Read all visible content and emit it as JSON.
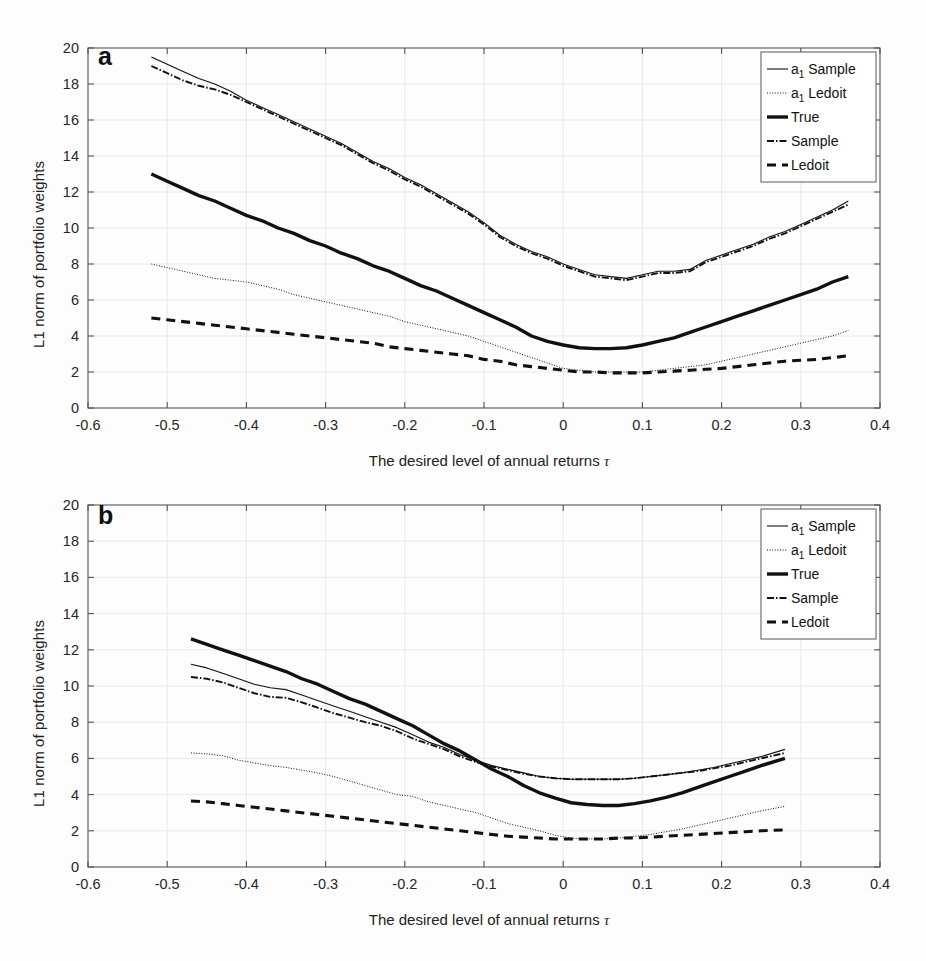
{
  "figure": {
    "background": "#fdfdfd",
    "line_color": "#111111",
    "grid_color": "#e3e3e3",
    "axis_color": "#555555"
  },
  "axis": {
    "xlabel_prefix": "The desired level of annual returns ",
    "xlabel_symbol": "τ",
    "ylabel": "L1 norm of portfolio weights",
    "x_ticks": [
      "-0.6",
      "-0.5",
      "-0.4",
      "-0.3",
      "-0.2",
      "-0.1",
      "0",
      "0.1",
      "0.2",
      "0.3",
      "0.4"
    ],
    "y_ticks": [
      "0",
      "2",
      "4",
      "6",
      "8",
      "10",
      "12",
      "14",
      "16",
      "18",
      "20"
    ]
  },
  "legend": {
    "entries": [
      {
        "label": "a",
        "sub": "1",
        "suffix": " Sample",
        "style": "thin-solid"
      },
      {
        "label": "a",
        "sub": "1",
        "suffix": " Ledoit",
        "style": "dotted"
      },
      {
        "label": "True",
        "sub": "",
        "suffix": "",
        "style": "thick-solid"
      },
      {
        "label": "Sample",
        "sub": "",
        "suffix": "",
        "style": "dash-dot"
      },
      {
        "label": "Ledoit",
        "sub": "",
        "suffix": "",
        "style": "dashed"
      }
    ]
  },
  "panels": [
    {
      "id": "a",
      "letter": "a"
    },
    {
      "id": "b",
      "letter": "b"
    }
  ],
  "chart_data": [
    {
      "type": "line",
      "panel": "a",
      "title": "a",
      "xlabel": "The desired level of annual returns τ",
      "ylabel": "L1 norm of portfolio weights",
      "xlim": [
        -0.6,
        0.4
      ],
      "ylim": [
        0,
        20
      ],
      "xticks": [
        -0.6,
        -0.5,
        -0.4,
        -0.3,
        -0.2,
        -0.1,
        0,
        0.1,
        0.2,
        0.3,
        0.4
      ],
      "yticks": [
        0,
        2,
        4,
        6,
        8,
        10,
        12,
        14,
        16,
        18,
        20
      ],
      "grid": true,
      "legend_position": "top-right",
      "x": [
        -0.52,
        -0.5,
        -0.48,
        -0.46,
        -0.44,
        -0.42,
        -0.4,
        -0.38,
        -0.36,
        -0.34,
        -0.32,
        -0.3,
        -0.28,
        -0.26,
        -0.24,
        -0.22,
        -0.2,
        -0.18,
        -0.16,
        -0.14,
        -0.12,
        -0.1,
        -0.08,
        -0.06,
        -0.04,
        -0.02,
        0.0,
        0.02,
        0.04,
        0.06,
        0.08,
        0.1,
        0.12,
        0.14,
        0.16,
        0.18,
        0.2,
        0.22,
        0.24,
        0.26,
        0.28,
        0.3,
        0.32,
        0.34,
        0.36
      ],
      "series": [
        {
          "name": "a1 Sample",
          "style": "thin-solid",
          "values": [
            19.5,
            19.1,
            18.7,
            18.3,
            18.0,
            17.6,
            17.1,
            16.7,
            16.3,
            15.9,
            15.5,
            15.1,
            14.7,
            14.2,
            13.7,
            13.3,
            12.8,
            12.4,
            11.9,
            11.4,
            10.9,
            10.3,
            9.6,
            9.1,
            8.7,
            8.4,
            8.0,
            7.7,
            7.4,
            7.3,
            7.2,
            7.4,
            7.6,
            7.6,
            7.7,
            8.2,
            8.5,
            8.8,
            9.1,
            9.5,
            9.8,
            10.2,
            10.6,
            11.0,
            11.5
          ]
        },
        {
          "name": "a1 Ledoit",
          "style": "dotted",
          "values": [
            8.0,
            7.8,
            7.6,
            7.4,
            7.2,
            7.1,
            7.0,
            6.8,
            6.6,
            6.3,
            6.1,
            5.9,
            5.7,
            5.5,
            5.3,
            5.1,
            4.8,
            4.6,
            4.4,
            4.2,
            4.0,
            3.7,
            3.4,
            3.1,
            2.8,
            2.5,
            2.2,
            2.1,
            2.0,
            2.0,
            2.0,
            2.0,
            2.1,
            2.2,
            2.3,
            2.4,
            2.6,
            2.8,
            3.0,
            3.2,
            3.4,
            3.6,
            3.8,
            4.0,
            4.3
          ]
        },
        {
          "name": "True",
          "style": "thick-solid",
          "values": [
            13.0,
            12.6,
            12.2,
            11.8,
            11.5,
            11.1,
            10.7,
            10.4,
            10.0,
            9.7,
            9.3,
            9.0,
            8.6,
            8.3,
            7.9,
            7.6,
            7.2,
            6.8,
            6.5,
            6.1,
            5.7,
            5.3,
            4.9,
            4.5,
            4.0,
            3.7,
            3.5,
            3.35,
            3.3,
            3.3,
            3.35,
            3.5,
            3.7,
            3.9,
            4.2,
            4.5,
            4.8,
            5.1,
            5.4,
            5.7,
            6.0,
            6.3,
            6.6,
            7.0,
            7.3
          ]
        },
        {
          "name": "Sample",
          "style": "dash-dot",
          "values": [
            19.0,
            18.6,
            18.2,
            17.9,
            17.7,
            17.4,
            17.0,
            16.6,
            16.2,
            15.8,
            15.4,
            15.0,
            14.6,
            14.1,
            13.6,
            13.2,
            12.7,
            12.3,
            11.8,
            11.3,
            10.8,
            10.2,
            9.5,
            9.0,
            8.6,
            8.3,
            7.9,
            7.6,
            7.3,
            7.2,
            7.1,
            7.3,
            7.5,
            7.5,
            7.6,
            8.1,
            8.4,
            8.7,
            9.0,
            9.4,
            9.7,
            10.1,
            10.5,
            10.9,
            11.3
          ]
        },
        {
          "name": "Ledoit",
          "style": "dashed",
          "values": [
            5.0,
            4.9,
            4.8,
            4.7,
            4.6,
            4.5,
            4.4,
            4.3,
            4.2,
            4.1,
            4.0,
            3.9,
            3.8,
            3.7,
            3.6,
            3.4,
            3.3,
            3.2,
            3.1,
            3.0,
            2.9,
            2.7,
            2.6,
            2.4,
            2.3,
            2.2,
            2.1,
            2.0,
            2.0,
            1.95,
            1.95,
            1.95,
            2.0,
            2.05,
            2.1,
            2.15,
            2.2,
            2.3,
            2.4,
            2.5,
            2.6,
            2.65,
            2.7,
            2.8,
            2.9
          ]
        }
      ]
    },
    {
      "type": "line",
      "panel": "b",
      "title": "b",
      "xlabel": "The desired level of annual returns τ",
      "ylabel": "L1 norm of portfolio weights",
      "xlim": [
        -0.6,
        0.4
      ],
      "ylim": [
        0,
        20
      ],
      "xticks": [
        -0.6,
        -0.5,
        -0.4,
        -0.3,
        -0.2,
        -0.1,
        0,
        0.1,
        0.2,
        0.3,
        0.4
      ],
      "yticks": [
        0,
        2,
        4,
        6,
        8,
        10,
        12,
        14,
        16,
        18,
        20
      ],
      "grid": true,
      "legend_position": "top-right",
      "x": [
        -0.47,
        -0.45,
        -0.43,
        -0.41,
        -0.39,
        -0.37,
        -0.35,
        -0.33,
        -0.31,
        -0.29,
        -0.27,
        -0.25,
        -0.23,
        -0.21,
        -0.19,
        -0.17,
        -0.15,
        -0.13,
        -0.11,
        -0.09,
        -0.07,
        -0.05,
        -0.03,
        -0.01,
        0.01,
        0.03,
        0.05,
        0.07,
        0.09,
        0.11,
        0.13,
        0.15,
        0.17,
        0.19,
        0.21,
        0.23,
        0.25,
        0.28
      ],
      "series": [
        {
          "name": "a1 Sample",
          "style": "thin-solid",
          "values": [
            11.2,
            11.0,
            10.7,
            10.4,
            10.1,
            9.9,
            9.8,
            9.5,
            9.2,
            8.9,
            8.6,
            8.3,
            8.0,
            7.7,
            7.3,
            6.9,
            6.6,
            6.2,
            5.9,
            5.6,
            5.4,
            5.2,
            5.0,
            4.9,
            4.85,
            4.85,
            4.85,
            4.85,
            4.9,
            5.0,
            5.1,
            5.2,
            5.35,
            5.5,
            5.7,
            5.9,
            6.1,
            6.5
          ]
        },
        {
          "name": "a1 Ledoit",
          "style": "dotted",
          "values": [
            6.3,
            6.25,
            6.15,
            5.9,
            5.75,
            5.6,
            5.5,
            5.35,
            5.2,
            5.0,
            4.75,
            4.5,
            4.25,
            4.0,
            3.9,
            3.6,
            3.4,
            3.2,
            3.0,
            2.7,
            2.4,
            2.2,
            2.0,
            1.75,
            1.6,
            1.55,
            1.55,
            1.6,
            1.7,
            1.8,
            1.95,
            2.1,
            2.3,
            2.5,
            2.7,
            2.9,
            3.1,
            3.35
          ]
        },
        {
          "name": "True",
          "style": "thick-solid",
          "values": [
            12.6,
            12.3,
            12.0,
            11.7,
            11.4,
            11.1,
            10.8,
            10.4,
            10.1,
            9.7,
            9.3,
            9.0,
            8.6,
            8.2,
            7.8,
            7.3,
            6.8,
            6.4,
            5.9,
            5.4,
            5.0,
            4.5,
            4.1,
            3.8,
            3.55,
            3.45,
            3.4,
            3.4,
            3.5,
            3.65,
            3.85,
            4.1,
            4.4,
            4.7,
            5.0,
            5.3,
            5.6,
            6.0
          ]
        },
        {
          "name": "Sample",
          "style": "dash-dot",
          "values": [
            10.5,
            10.4,
            10.2,
            9.9,
            9.6,
            9.4,
            9.35,
            9.1,
            8.8,
            8.5,
            8.25,
            8.0,
            7.8,
            7.5,
            7.1,
            6.8,
            6.5,
            6.1,
            5.8,
            5.55,
            5.35,
            5.15,
            5.0,
            4.9,
            4.85,
            4.85,
            4.85,
            4.85,
            4.9,
            5.0,
            5.1,
            5.2,
            5.3,
            5.45,
            5.6,
            5.8,
            6.0,
            6.3
          ]
        },
        {
          "name": "Ledoit",
          "style": "dashed",
          "values": [
            3.65,
            3.6,
            3.5,
            3.4,
            3.3,
            3.2,
            3.1,
            3.0,
            2.9,
            2.8,
            2.7,
            2.6,
            2.5,
            2.4,
            2.3,
            2.2,
            2.1,
            2.0,
            1.9,
            1.8,
            1.7,
            1.65,
            1.6,
            1.55,
            1.55,
            1.55,
            1.55,
            1.6,
            1.6,
            1.65,
            1.7,
            1.75,
            1.8,
            1.85,
            1.9,
            1.95,
            2.0,
            2.05
          ]
        }
      ]
    }
  ]
}
